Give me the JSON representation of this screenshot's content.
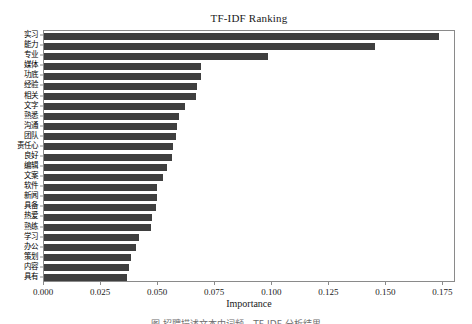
{
  "figure": {
    "caption_partial": "图   招聘描述文本中词频 - TF-IDF 分析结果"
  },
  "chart_data": {
    "type": "bar",
    "orientation": "horizontal",
    "title": "TF-IDF Ranking",
    "xlabel": "Importance",
    "ylabel": "",
    "xlim": [
      0.0,
      0.1805
    ],
    "grid": false,
    "legend": null,
    "bar_color": "#3f3f3f",
    "frame_color": "#8a8a8a",
    "xticks": [
      0.0,
      0.025,
      0.05,
      0.075,
      0.1,
      0.125,
      0.15,
      0.175
    ],
    "xtick_labels": [
      "0.000",
      "0.025",
      "0.050",
      "0.075",
      "0.100",
      "0.125",
      "0.150",
      "0.175"
    ],
    "categories": [
      "实习",
      "能力",
      "专业",
      "媒体",
      "功底",
      "经验",
      "相关",
      "文字",
      "熟悉",
      "沟通",
      "团队",
      "责任心",
      "良好",
      "编辑",
      "文案",
      "软件",
      "新闻",
      "具备",
      "热爱",
      "熟练",
      "学习",
      "办公",
      "策划",
      "内容",
      "具有"
    ],
    "values": [
      0.1731,
      0.1452,
      0.098,
      0.069,
      0.069,
      0.0672,
      0.0665,
      0.0617,
      0.0592,
      0.0583,
      0.0578,
      0.0565,
      0.056,
      0.0539,
      0.0522,
      0.0496,
      0.0493,
      0.0489,
      0.0473,
      0.0468,
      0.0416,
      0.0405,
      0.0383,
      0.0373,
      0.0365
    ]
  }
}
